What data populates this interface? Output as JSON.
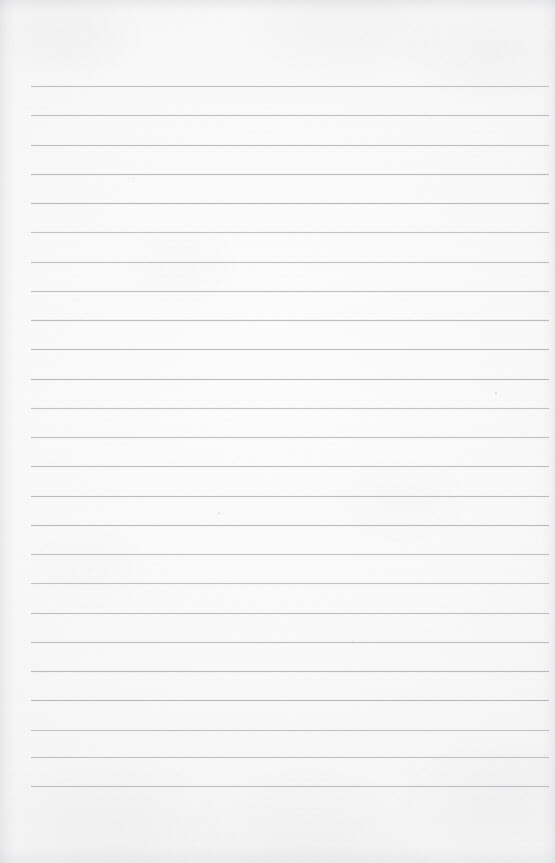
{
  "document": {
    "kind": "scanned-page",
    "title": "Blank ruled notebook page",
    "content_text": "",
    "is_blank": true,
    "orientation": "portrait",
    "page_width_px": 555,
    "page_height_px": 863
  },
  "paper": {
    "base_color": "#fbfbfb",
    "highlight_color": "#fdfdfd",
    "shade_color": "#f6f6f7",
    "texture": "fine-grain-scan-noise",
    "edge_shadow_color": "#787e86"
  },
  "ruling": {
    "line_color": "#b4b9bf",
    "line_thickness_px": 1,
    "line_count": 25,
    "first_line_y_px": 86,
    "line_spacing_px": 29.2,
    "left_margin_px": 31,
    "right_margin_px": 549,
    "line_length_px": 518,
    "has_vertical_margin_rule": false,
    "style": "wide-ruled-horizontal"
  },
  "lines": [
    {
      "index": 1,
      "y": 86,
      "text": ""
    },
    {
      "index": 2,
      "y": 115,
      "text": ""
    },
    {
      "index": 3,
      "y": 145,
      "text": ""
    },
    {
      "index": 4,
      "y": 174,
      "text": ""
    },
    {
      "index": 5,
      "y": 203,
      "text": ""
    },
    {
      "index": 6,
      "y": 232,
      "text": ""
    },
    {
      "index": 7,
      "y": 262,
      "text": ""
    },
    {
      "index": 8,
      "y": 291,
      "text": ""
    },
    {
      "index": 9,
      "y": 320,
      "text": ""
    },
    {
      "index": 10,
      "y": 349,
      "text": ""
    },
    {
      "index": 11,
      "y": 379,
      "text": ""
    },
    {
      "index": 12,
      "y": 408,
      "text": ""
    },
    {
      "index": 13,
      "y": 437,
      "text": ""
    },
    {
      "index": 14,
      "y": 466,
      "text": ""
    },
    {
      "index": 15,
      "y": 496,
      "text": ""
    },
    {
      "index": 16,
      "y": 525,
      "text": ""
    },
    {
      "index": 17,
      "y": 554,
      "text": ""
    },
    {
      "index": 18,
      "y": 583,
      "text": ""
    },
    {
      "index": 19,
      "y": 613,
      "text": ""
    },
    {
      "index": 20,
      "y": 642,
      "text": ""
    },
    {
      "index": 21,
      "y": 671,
      "text": ""
    },
    {
      "index": 22,
      "y": 700,
      "text": ""
    },
    {
      "index": 23,
      "y": 730,
      "text": ""
    },
    {
      "index": 24,
      "y": 757,
      "text": ""
    },
    {
      "index": 25,
      "y": 786,
      "text": ""
    }
  ],
  "specks": [
    {
      "x": 218,
      "y": 512,
      "size": 2.0
    },
    {
      "x": 222,
      "y": 513,
      "size": 1.4
    },
    {
      "x": 495,
      "y": 392,
      "size": 1.6
    },
    {
      "x": 133,
      "y": 178,
      "size": 1.3
    },
    {
      "x": 352,
      "y": 640,
      "size": 1.3
    },
    {
      "x": 78,
      "y": 300,
      "size": 1.2
    },
    {
      "x": 430,
      "y": 118,
      "size": 1.2
    }
  ],
  "margins": {
    "top_blank_band_px": 86,
    "bottom_blank_band_px": 77
  }
}
